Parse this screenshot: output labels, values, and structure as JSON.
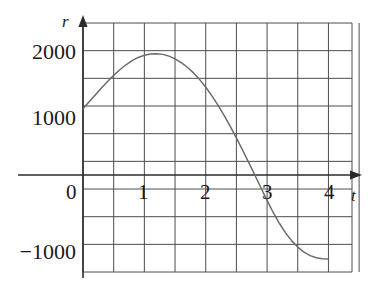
{
  "chart_data": {
    "type": "line",
    "title": "",
    "xlabel": "t",
    "ylabel": "r",
    "xlim": [
      -0.38,
      8.75
    ],
    "ylim": [
      -1722,
      2590
    ],
    "grid": true,
    "legend": null,
    "x_ticks": [
      "0",
      "1",
      "2",
      "3",
      "4"
    ],
    "x_tick_values": [
      0,
      1,
      2,
      3,
      4
    ],
    "y_ticks": [
      "2000",
      "1000",
      "-1000"
    ],
    "y_tick_values": [
      2000,
      1000,
      -1000
    ],
    "series": [
      {
        "name": "r(t)",
        "x": [
          0,
          0.1,
          0.2,
          0.3,
          0.4,
          0.5,
          0.6,
          0.7,
          0.8,
          0.9,
          1.0,
          1.1,
          1.2,
          1.3,
          1.4,
          1.5,
          1.6,
          1.7,
          1.8,
          1.9,
          2.0,
          2.1,
          2.2,
          2.3,
          2.4,
          2.5,
          2.6,
          2.7,
          2.8,
          2.9,
          3.0,
          3.1,
          3.2,
          3.3,
          3.4,
          3.5,
          3.6,
          3.7,
          3.8,
          3.9,
          4.0
        ],
        "y": [
          1000,
          1105,
          1210,
          1313,
          1412,
          1505,
          1590,
          1665,
          1727,
          1776,
          1810,
          1829,
          1833,
          1822,
          1796,
          1755,
          1699,
          1628,
          1542,
          1441,
          1325,
          1195,
          1052,
          897,
          731,
          556,
          374,
          186,
          -4,
          -196,
          -388,
          -570,
          -733,
          -875,
          -995,
          -1092,
          -1166,
          -1218,
          -1250,
          -1266,
          -1270
        ]
      }
    ],
    "annotations": []
  },
  "axes": {
    "y_axis_name": "r",
    "x_axis_name": "t",
    "y_labels": [
      {
        "text": "2000",
        "value": 2000
      },
      {
        "text": "1000",
        "value": 1000
      },
      {
        "text": "−1000",
        "value": -1000
      }
    ],
    "x_labels": [
      {
        "text": "0",
        "value": 0
      },
      {
        "text": "1",
        "value": 1
      },
      {
        "text": "2",
        "value": 2
      },
      {
        "text": "3",
        "value": 3
      },
      {
        "text": "4",
        "value": 4
      }
    ]
  },
  "colors": {
    "curve": "#6b6b6b",
    "grid": "#4d4d4d",
    "axis": "#2b2b2b",
    "text": "#1a1a1a",
    "background": "#ffffff"
  }
}
